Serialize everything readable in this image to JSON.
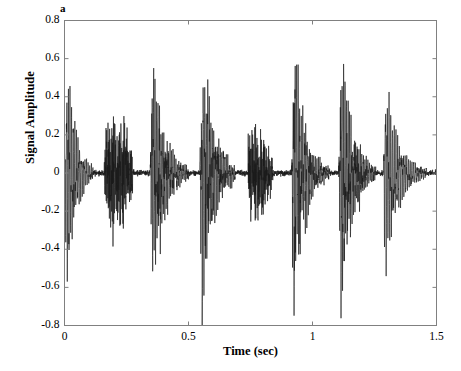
{
  "panel": {
    "label": "a"
  },
  "axes": {
    "x": {
      "title": "Time (sec)",
      "ticks": [
        "0",
        "0.5",
        "1",
        "1.5"
      ],
      "tick_values": [
        0,
        0.5,
        1,
        1.5
      ],
      "range": [
        0,
        1.5
      ]
    },
    "y": {
      "title": "Signal Amplitude",
      "ticks": [
        "0.8",
        "0.6",
        "0.4",
        "0.2",
        "0",
        "-0.2",
        "-0.4",
        "-0.6",
        "-0.8"
      ],
      "tick_values": [
        0.8,
        0.6,
        0.4,
        0.2,
        0,
        -0.2,
        -0.4,
        -0.6,
        -0.8
      ],
      "range": [
        -0.8,
        0.8
      ]
    }
  },
  "style": {
    "line_color": "#1a1a1a",
    "axis_color": "#808080",
    "background": "#ffffff"
  },
  "chart_data": {
    "type": "line",
    "title": "",
    "xlabel": "Time (sec)",
    "ylabel": "Signal Amplitude",
    "xlim": [
      0,
      1.5
    ],
    "ylim": [
      -0.8,
      0.8
    ],
    "grid": false,
    "legend": "none",
    "series_name": "signal",
    "bursts": [
      {
        "center": 0.035,
        "onset": 0.0,
        "end": 0.115,
        "peak_pos": 0.52,
        "peak_neg": -0.6,
        "carrier_hz": 150,
        "envelope": "decay",
        "decay": 26,
        "noise": 0.1
      },
      {
        "center": 0.215,
        "onset": 0.16,
        "end": 0.275,
        "peak_pos": 0.23,
        "peak_neg": -0.26,
        "carrier_hz": 330,
        "envelope": "gauss",
        "decay": 0,
        "noise": 0.55
      },
      {
        "center": 0.395,
        "onset": 0.345,
        "end": 0.5,
        "peak_pos": 0.69,
        "peak_neg": -0.7,
        "carrier_hz": 165,
        "envelope": "decay",
        "decay": 22,
        "noise": 0.3
      },
      {
        "center": 0.585,
        "onset": 0.545,
        "end": 0.69,
        "peak_pos": 0.7,
        "peak_neg": -0.72,
        "carrier_hz": 160,
        "envelope": "decay",
        "decay": 21,
        "noise": 0.28
      },
      {
        "center": 0.78,
        "onset": 0.74,
        "end": 0.84,
        "peak_pos": 0.2,
        "peak_neg": -0.22,
        "carrier_hz": 340,
        "envelope": "gauss",
        "decay": 0,
        "noise": 0.55
      },
      {
        "center": 0.96,
        "onset": 0.915,
        "end": 1.07,
        "peak_pos": 0.68,
        "peak_neg": -0.66,
        "carrier_hz": 158,
        "envelope": "decay",
        "decay": 22,
        "noise": 0.26
      },
      {
        "center": 1.15,
        "onset": 1.105,
        "end": 1.255,
        "peak_pos": 0.67,
        "peak_neg": -0.7,
        "carrier_hz": 162,
        "envelope": "decay",
        "decay": 21,
        "noise": 0.3
      },
      {
        "center": 1.32,
        "onset": 1.285,
        "end": 1.46,
        "peak_pos": 0.44,
        "peak_neg": -0.48,
        "carrier_hz": 140,
        "envelope": "decay",
        "decay": 19,
        "noise": 0.12
      }
    ],
    "baseline_noise": 0.012,
    "sample_count": 3200
  }
}
